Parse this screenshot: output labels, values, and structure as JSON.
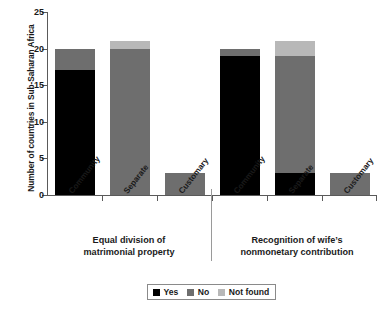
{
  "chart_data": {
    "type": "bar",
    "stacked": true,
    "title": "",
    "xlabel": "",
    "ylabel": "Number of countries in Sub-Saharan Africa",
    "ylim": [
      0,
      25
    ],
    "yticks": [
      0,
      5,
      10,
      15,
      20,
      25
    ],
    "ytick_labels": [
      "0",
      "5",
      "10",
      "15",
      "20",
      "25"
    ],
    "grid": false,
    "legend_position": "bottom-center",
    "series": [
      {
        "name": "Yes",
        "color": "#000000",
        "values": [
          17,
          0,
          0,
          19,
          3,
          0
        ]
      },
      {
        "name": "No",
        "color": "#6e6e6e",
        "values": [
          3,
          20,
          3,
          1,
          16,
          3
        ]
      },
      {
        "name": "Not found",
        "color": "#b8b8b8",
        "values": [
          0,
          1,
          0,
          0,
          2,
          0
        ]
      }
    ],
    "categories": [
      "Community",
      "Separate",
      "Customary",
      "Community",
      "Separate",
      "Customary"
    ],
    "totals": [
      20,
      21,
      3,
      20,
      21,
      3
    ],
    "groups": [
      {
        "title_line1": "Equal division of",
        "title_line2": "matrimonial property",
        "categories": [
          "Community",
          "Separate",
          "Customary"
        ]
      },
      {
        "title_line1": "Recognition of wife’s",
        "title_line2": "nonmonetary contribution",
        "categories": [
          "Community",
          "Separate",
          "Customary"
        ]
      }
    ],
    "bars": [
      {
        "category": "Community",
        "group": 0,
        "segments": [
          {
            "series": "Yes",
            "value": 17
          },
          {
            "series": "No",
            "value": 3
          },
          {
            "series": "Not found",
            "value": 0
          }
        ]
      },
      {
        "category": "Separate",
        "group": 0,
        "segments": [
          {
            "series": "Yes",
            "value": 0
          },
          {
            "series": "No",
            "value": 20
          },
          {
            "series": "Not found",
            "value": 1
          }
        ]
      },
      {
        "category": "Customary",
        "group": 0,
        "segments": [
          {
            "series": "Yes",
            "value": 0
          },
          {
            "series": "No",
            "value": 3
          },
          {
            "series": "Not found",
            "value": 0
          }
        ]
      },
      {
        "category": "Community",
        "group": 1,
        "segments": [
          {
            "series": "Yes",
            "value": 19
          },
          {
            "series": "No",
            "value": 1
          },
          {
            "series": "Not found",
            "value": 0
          }
        ]
      },
      {
        "category": "Separate",
        "group": 1,
        "segments": [
          {
            "series": "Yes",
            "value": 3
          },
          {
            "series": "No",
            "value": 16
          },
          {
            "series": "Not found",
            "value": 2
          }
        ]
      },
      {
        "category": "Customary",
        "group": 1,
        "segments": [
          {
            "series": "Yes",
            "value": 0
          },
          {
            "series": "No",
            "value": 3
          },
          {
            "series": "Not found",
            "value": 0
          }
        ]
      }
    ],
    "legend": [
      {
        "label": "Yes",
        "color": "#000000"
      },
      {
        "label": "No",
        "color": "#6e6e6e"
      },
      {
        "label": "Not found",
        "color": "#b8b8b8"
      }
    ]
  },
  "axis": {
    "y_title": "Number of countries in Sub-Saharan Africa",
    "ytick_0": "0",
    "ytick_1": "5",
    "ytick_2": "10",
    "ytick_3": "15",
    "ytick_4": "20",
    "ytick_5": "25"
  },
  "labels": {
    "cat_0": "Community",
    "cat_1": "Separate",
    "cat_2": "Customary",
    "cat_3": "Community",
    "cat_4": "Separate",
    "cat_5": "Customary",
    "group0_line1": "Equal division of",
    "group0_line2": "matrimonial property",
    "group1_line1": "Recognition of wife’s",
    "group1_line2": "nonmonetary contribution"
  },
  "legend": {
    "yes": "Yes",
    "no": "No",
    "not_found": "Not found"
  },
  "colors": {
    "yes": "#000000",
    "no": "#6e6e6e",
    "not_found": "#b8b8b8",
    "axis": "#5a5a5a",
    "text": "#1a1a1a",
    "background": "#ffffff"
  }
}
